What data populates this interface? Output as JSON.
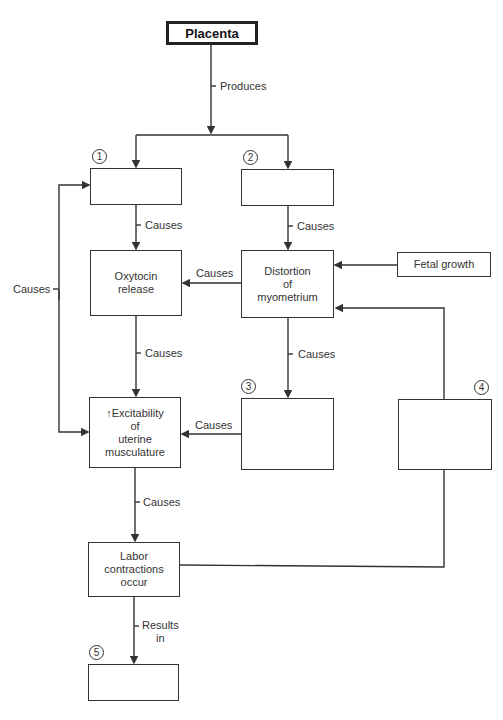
{
  "diagram": {
    "nodes": {
      "placenta": {
        "label": "Placenta"
      },
      "box1": {
        "number": "1",
        "label": ""
      },
      "box2": {
        "number": "2",
        "label": ""
      },
      "oxytocin": {
        "label": "Oxytocin\nrelease"
      },
      "distortion": {
        "label": "Distortion\nof\nmyometrium"
      },
      "fetal_growth": {
        "label": "Fetal growth"
      },
      "excitability": {
        "label": "↑Excitability\nof\nuterine\nmusculature"
      },
      "box3": {
        "number": "3",
        "label": ""
      },
      "box4": {
        "number": "4",
        "label": ""
      },
      "labor": {
        "label": "Labor\ncontractions\noccur"
      },
      "box5": {
        "number": "5",
        "label": ""
      }
    },
    "edges": {
      "placenta_produces": "Produces",
      "box1_oxytocin": "Causes",
      "box2_distortion": "Causes",
      "distortion_oxytocin": "Causes",
      "loop_left": "Causes",
      "oxytocin_excitability": "Causes",
      "distortion_box3": "Causes",
      "box3_excitability": "Causes",
      "excitability_labor": "Causes",
      "labor_box5": "Results\nin"
    }
  }
}
